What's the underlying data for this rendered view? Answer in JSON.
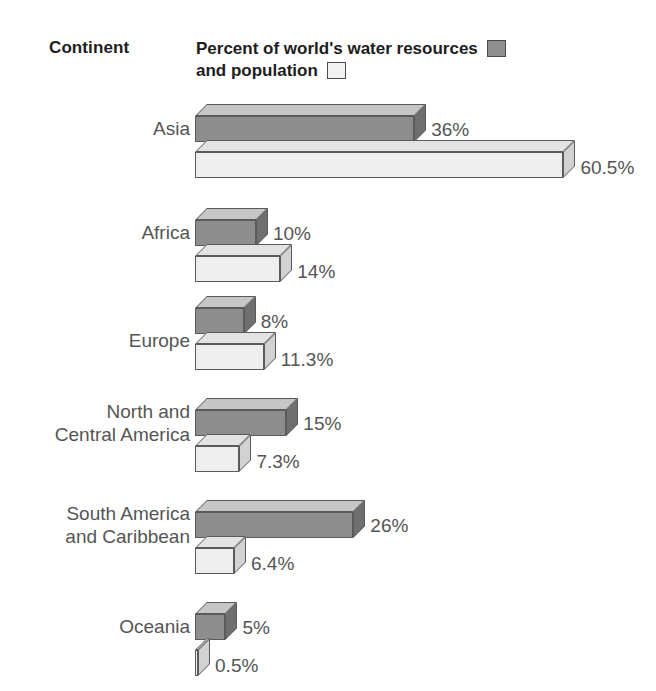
{
  "header": {
    "category_title": "Continent",
    "metric_title_line1": "Percent of world's water resources",
    "metric_title_line2": "and population",
    "legend": [
      {
        "key": "water",
        "label": "Percent of world's water resources",
        "swatch": "dark-grey-swatch",
        "color": "#8d8d8d"
      },
      {
        "key": "population",
        "label": "and population",
        "swatch": "white-swatch",
        "color": "#eeeeee"
      }
    ]
  },
  "chart_data": {
    "type": "bar",
    "title": "Percent of world's water resources and population",
    "xlabel": "",
    "ylabel": "Continent",
    "orientation": "horizontal",
    "style": "3d-isometric",
    "grid": false,
    "legend_position": "top-right",
    "xlim": [
      0,
      60.5
    ],
    "categories": [
      "Asia",
      "Africa",
      "Europe",
      "North and\nCentral America",
      "South America\nand Caribbean",
      "Oceania"
    ],
    "series": [
      {
        "name": "Percent of world's water resources",
        "color": "#8d8d8d",
        "values": [
          36,
          10,
          8,
          15,
          26,
          5
        ],
        "labels": [
          "36%",
          "10%",
          "8%",
          "15%",
          "26%",
          "5%"
        ]
      },
      {
        "name": "Percent of world's population",
        "color": "#eeeeee",
        "values": [
          60.5,
          14,
          11.3,
          7.3,
          6.4,
          0.5
        ],
        "labels": [
          "60.5%",
          "14%",
          "11.3%",
          "7.3%",
          "6.4%",
          "0.5%"
        ]
      }
    ]
  },
  "colors": {
    "background": "#ffffff",
    "dark_bar_face": "#8d8d8d",
    "dark_bar_top": "#c6c6c6",
    "light_bar_face": "#eeeeee",
    "outline": "#5a5a5a",
    "label_text": "#555555",
    "header_text": "#1d1d1d"
  }
}
